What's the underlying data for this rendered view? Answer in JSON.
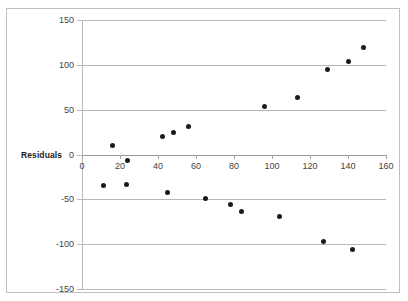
{
  "figure": {
    "axis_title": "Residuals",
    "frame_color": "#bfbfbf",
    "gridline_color": "#b7b7b7",
    "point_color": "#1b1b1b",
    "background": "#ffffff"
  },
  "chart_data": {
    "type": "scatter",
    "title": "",
    "xlabel": "",
    "ylabel": "Residuals",
    "xlim": [
      0,
      160
    ],
    "ylim": [
      -150,
      150
    ],
    "xticks": [
      0,
      20,
      40,
      60,
      80,
      100,
      120,
      140,
      160
    ],
    "xtick_labels": [
      "0",
      "20",
      "40",
      "60",
      "80",
      "100",
      "120",
      "140",
      "160"
    ],
    "yticks": [
      -150,
      -100,
      -50,
      0,
      50,
      100,
      150
    ],
    "ytick_labels": [
      "-150",
      "-100",
      "-50",
      "0",
      "50",
      "100",
      "150"
    ],
    "grid": "horizontal",
    "legend": "none",
    "series": [
      {
        "name": "Residuals",
        "marker": "circle",
        "color": "#1b1b1b",
        "points": [
          {
            "x": 8,
            "y": -26
          },
          {
            "x": 13,
            "y": 19
          },
          {
            "x": 20,
            "y": -25
          },
          {
            "x": 21,
            "y": 2
          },
          {
            "x": 39,
            "y": 29
          },
          {
            "x": 42,
            "y": -34
          },
          {
            "x": 45,
            "y": 34
          },
          {
            "x": 53,
            "y": 40
          },
          {
            "x": 62,
            "y": -40
          },
          {
            "x": 75,
            "y": -47
          },
          {
            "x": 81,
            "y": -55
          },
          {
            "x": 93,
            "y": 63
          },
          {
            "x": 101,
            "y": -60
          },
          {
            "x": 110,
            "y": 72
          },
          {
            "x": 124,
            "y": -88
          },
          {
            "x": 126,
            "y": 104
          },
          {
            "x": 137,
            "y": 113
          },
          {
            "x": 139,
            "y": -97
          },
          {
            "x": 145,
            "y": 128
          }
        ]
      }
    ]
  }
}
